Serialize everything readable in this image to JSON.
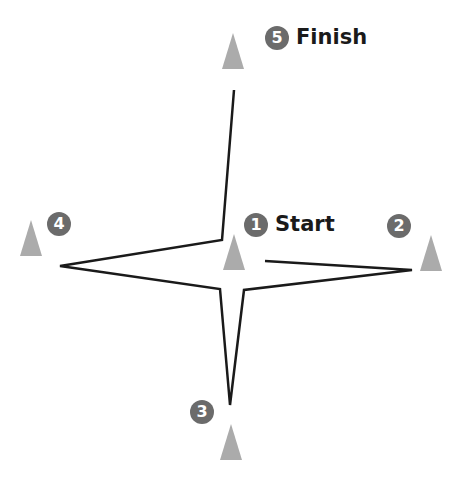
{
  "diagram": {
    "type": "cone-drill-course",
    "colors": {
      "cone": "#ababab",
      "badge": "#6b6b6b",
      "badge_text": "#ffffff",
      "path": "#1a1a1a",
      "label": "#1a1a1a"
    },
    "cones": [
      {
        "id": 1,
        "badge": "1",
        "label": "Start"
      },
      {
        "id": 2,
        "badge": "2",
        "label": ""
      },
      {
        "id": 3,
        "badge": "3",
        "label": ""
      },
      {
        "id": 4,
        "badge": "4",
        "label": ""
      },
      {
        "id": 5,
        "badge": "5",
        "label": "Finish"
      }
    ],
    "path_points": [
      [
        265,
        261
      ],
      [
        412,
        270
      ],
      [
        244,
        290
      ],
      [
        230,
        405
      ],
      [
        220,
        289
      ],
      [
        60,
        266
      ],
      [
        222,
        240
      ],
      [
        234,
        90
      ]
    ]
  }
}
